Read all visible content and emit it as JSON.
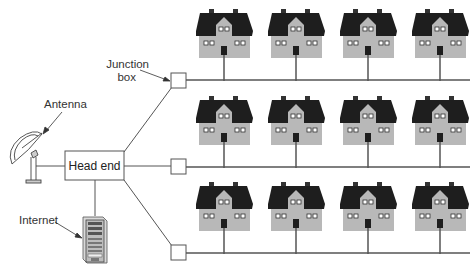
{
  "labels": {
    "junction_box_line1": "Junction",
    "junction_box_line2": "box",
    "antenna": "Antenna",
    "head_end": "Head end",
    "internet": "Internet"
  },
  "diagram": {
    "type": "cable-tv-network",
    "rows": 3,
    "houses_per_row": 4,
    "junction_boxes": 3,
    "colors": {
      "roof": "#1e1e1e",
      "wall": "#b8b8b8",
      "line": "#555555",
      "box_stroke": "#555555"
    }
  }
}
